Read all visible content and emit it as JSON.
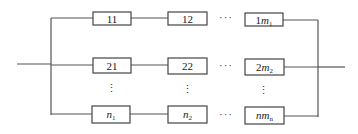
{
  "diagram": {
    "rows": [
      {
        "boxes": [
          {
            "main": "11",
            "italic": false,
            "sub": ""
          },
          {
            "main": "12",
            "italic": false,
            "sub": ""
          },
          {
            "prefix": "1",
            "main": "m",
            "italic": true,
            "sub": "1"
          }
        ]
      },
      {
        "boxes": [
          {
            "main": "21",
            "italic": false,
            "sub": ""
          },
          {
            "main": "22",
            "italic": false,
            "sub": ""
          },
          {
            "prefix": "2",
            "main": "m",
            "italic": true,
            "sub": "2"
          }
        ]
      },
      {
        "boxes": [
          {
            "main": "n",
            "italic": true,
            "sub": "1"
          },
          {
            "main": "n",
            "italic": true,
            "sub": "2"
          },
          {
            "prefix": "",
            "main": "nm",
            "italic": true,
            "sub": "n"
          }
        ]
      }
    ],
    "horizontal_ellipsis": "···",
    "vertical_ellipsis": "⋮",
    "line_color": "#555555",
    "box_border_color": "#444444"
  }
}
